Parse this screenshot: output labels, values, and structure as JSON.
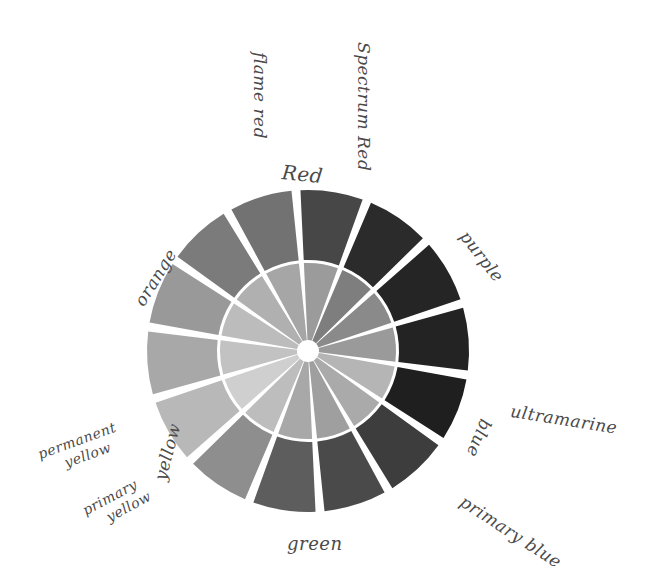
{
  "wheel": {
    "center": [
      308,
      351
    ],
    "outer_radius": 161,
    "ring_split_radius": 88,
    "hub_radius": 9,
    "gap_color": "#ffffff",
    "segment_count": 12,
    "start_angle_deg": -30,
    "outer_segments": [
      {
        "name": "flame-red",
        "color": "#6e6e6e"
      },
      {
        "name": "spectrum-red",
        "color": "#474747"
      },
      {
        "name": "red-purple",
        "color": "#2c2c2c"
      },
      {
        "name": "purple",
        "color": "#252525"
      },
      {
        "name": "blue-purple",
        "color": "#232323"
      },
      {
        "name": "ultramarine",
        "color": "#1f1f1f"
      },
      {
        "name": "blue",
        "color": "#3e3e3e"
      },
      {
        "name": "primary-blue",
        "color": "#474747"
      },
      {
        "name": "green",
        "color": "#5c5c5c"
      },
      {
        "name": "yellow-green",
        "color": "#8f8f8f"
      },
      {
        "name": "primary-yellow",
        "color": "#b9b9b9"
      },
      {
        "name": "permanent-yellow",
        "color": "#a9a9a9"
      },
      {
        "name": "yellow-orange",
        "color": "#979797"
      },
      {
        "name": "orange",
        "color": "#7a7a7a"
      }
    ],
    "outer_colors": [
      "#727272",
      "#474747",
      "#2b2b2b",
      "#252525",
      "#232323",
      "#1f1f1f",
      "#3d3d3d",
      "#4a4a4a",
      "#5d5d5d",
      "#8e8e8e",
      "#b8b8b8",
      "#a8a8a8",
      "#999999",
      "#7b7b7b",
      "#7a7a7a"
    ],
    "inner_colors": [
      "#a6a6a6",
      "#9b9b9b",
      "#7e7e7e",
      "#8a8a8a",
      "#9a9a9a",
      "#b5b5b5",
      "#aaaaaa",
      "#9f9f9f",
      "#a8a8a8",
      "#bdbdbd",
      "#cfcfcf",
      "#c2c2c2",
      "#bcbcbc",
      "#b0b0b0"
    ],
    "segments": 14
  },
  "labels": {
    "spectrum_red": "Spectrum Red",
    "flame_red": "flame red",
    "red": "Red",
    "purple": "purple",
    "ultramarine": "ultramarine",
    "blue": "blue",
    "primary_blue": "primary blue",
    "green": "green",
    "primary_yellow_1": "primary",
    "primary_yellow_2": "yellow",
    "yellow": "yellow",
    "permanent_yellow_1": "permanent",
    "permanent_yellow_2": "yellow",
    "orange": "orange"
  }
}
